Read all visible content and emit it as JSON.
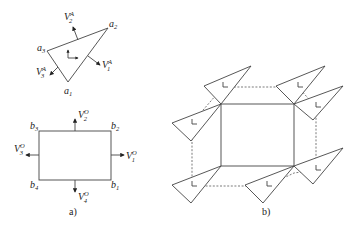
{
  "figure_a": {
    "caption": "a)",
    "triangle": {
      "vertices": [
        {
          "label": "a",
          "sub": "1"
        },
        {
          "label": "a",
          "sub": "2"
        },
        {
          "label": "a",
          "sub": "3"
        }
      ],
      "vectors": [
        {
          "label": "V",
          "sub": "1",
          "sup": "A"
        },
        {
          "label": "V",
          "sub": "2",
          "sup": "A"
        },
        {
          "label": "V",
          "sub": "3",
          "sup": "A"
        }
      ]
    },
    "rectangle": {
      "vertices": [
        {
          "label": "b",
          "sub": "1"
        },
        {
          "label": "b",
          "sub": "2"
        },
        {
          "label": "b",
          "sub": "3"
        },
        {
          "label": "b",
          "sub": "4"
        }
      ],
      "vectors": [
        {
          "label": "V",
          "sub": "1",
          "sup": "O"
        },
        {
          "label": "V",
          "sub": "2",
          "sup": "O"
        },
        {
          "label": "V",
          "sub": "3",
          "sup": "O"
        },
        {
          "label": "V",
          "sub": "4",
          "sup": "O"
        }
      ]
    }
  },
  "figure_b": {
    "caption": "b)",
    "description": "Rectangle with triangles placed at its corners; dashed lines connect triangle local frames"
  }
}
